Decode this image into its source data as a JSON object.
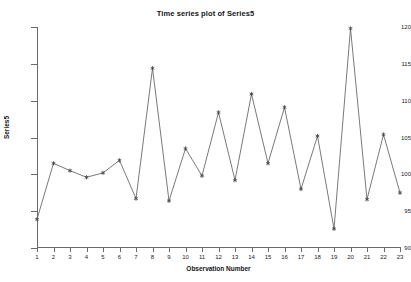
{
  "chart_data": {
    "type": "line",
    "title": "Time series plot of Series5",
    "xlabel": "Observation Number",
    "ylabel": "Series5",
    "x": [
      1,
      2,
      3,
      4,
      5,
      6,
      7,
      8,
      9,
      10,
      11,
      12,
      13,
      14,
      15,
      16,
      17,
      18,
      19,
      20,
      21,
      22,
      23
    ],
    "values": [
      93.9,
      101.5,
      100.5,
      99.6,
      100.2,
      101.9,
      96.7,
      114.4,
      96.4,
      103.5,
      99.8,
      108.4,
      99.2,
      110.9,
      101.5,
      109.1,
      98.0,
      105.2,
      92.6,
      119.8,
      96.6,
      105.4,
      97.5
    ],
    "xtick_labels": [
      "1",
      "2",
      "3",
      "4",
      "5",
      "6",
      "7",
      "8",
      "9",
      "10",
      "11",
      "12",
      "13",
      "14",
      "15",
      "16",
      "17",
      "18",
      "19",
      "20",
      "21",
      "22",
      "23"
    ],
    "ytick_labels": [
      "90",
      "95",
      "100",
      "105",
      "110",
      "115",
      "120"
    ],
    "yticks": [
      90,
      95,
      100,
      105,
      110,
      115,
      120
    ],
    "ylim": [
      90,
      120
    ],
    "xlim": [
      1,
      23
    ],
    "grid": false,
    "legend": false,
    "marker": "star",
    "line_color": "#6a6a6a",
    "marker_color": "#4a4a4a",
    "axis_color": "#6a6a6a",
    "background_color": "#ffffff"
  }
}
